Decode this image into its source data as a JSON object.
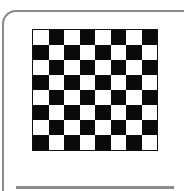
{
  "image": {
    "icon": "checkerboard-icon",
    "rows": 8,
    "cols": 8,
    "colors": {
      "light": "#ffffff",
      "dark": "#0a0a0a",
      "frame": "#8a8a8a",
      "underline": "#8c8c8c"
    }
  }
}
